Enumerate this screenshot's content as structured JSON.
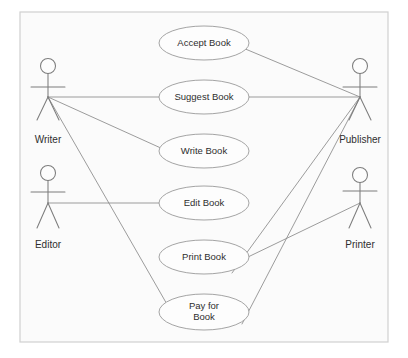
{
  "diagram": {
    "type": "uml-use-case-diagram",
    "title": "",
    "canvas": {
      "width": 408,
      "height": 358
    },
    "colors": {
      "page_background": "#ffffff",
      "frame_fill": "#fbfbfb",
      "frame_stroke": "#d0d0d0",
      "ellipse_fill": "#fdfdfd",
      "ellipse_stroke": "#9a9a9a",
      "line_stroke": "#8a8a8a",
      "actor_stroke": "#7d7d7d",
      "text_color": "#2e2e2e"
    },
    "frame": {
      "x": 20,
      "y": 12,
      "width": 368,
      "height": 330
    },
    "use_cases": [
      {
        "id": "accept-book",
        "label": "Accept Book",
        "label_lines": [
          "Accept Book"
        ],
        "cx": 204,
        "cy": 43,
        "rx": 45,
        "ry": 17
      },
      {
        "id": "suggest-book",
        "label": "Suggest Book",
        "label_lines": [
          "Suggest Book"
        ],
        "cx": 204,
        "cy": 97,
        "rx": 45,
        "ry": 17
      },
      {
        "id": "write-book",
        "label": "Write Book",
        "label_lines": [
          "Write Book"
        ],
        "cx": 204,
        "cy": 151,
        "rx": 45,
        "ry": 17
      },
      {
        "id": "edit-book",
        "label": "Edit Book",
        "label_lines": [
          "Edit Book"
        ],
        "cx": 204,
        "cy": 203,
        "rx": 45,
        "ry": 17
      },
      {
        "id": "print-book",
        "label": "Print Book",
        "label_lines": [
          "Print Book"
        ],
        "cx": 204,
        "cy": 257,
        "rx": 45,
        "ry": 17
      },
      {
        "id": "pay-for-book",
        "label": "Pay for Book",
        "label_lines": [
          "Pay for",
          "Book"
        ],
        "cx": 204,
        "cy": 312,
        "rx": 45,
        "ry": 18
      }
    ],
    "actors": [
      {
        "id": "writer",
        "label": "Writer",
        "x": 48,
        "head_cy": 66,
        "head_r": 7.5,
        "arms_y": 87,
        "hip_y": 97,
        "feet_y": 120,
        "leg_spread": 11,
        "arm_spread": 17,
        "label_y": 140
      },
      {
        "id": "editor",
        "label": "Editor",
        "x": 48,
        "head_cy": 173,
        "head_r": 7.5,
        "arms_y": 192,
        "hip_y": 203,
        "feet_y": 228,
        "leg_spread": 11,
        "arm_spread": 17,
        "label_y": 245
      },
      {
        "id": "publisher",
        "label": "Publisher",
        "x": 360,
        "head_cy": 66,
        "head_r": 7.5,
        "arms_y": 87,
        "hip_y": 97,
        "feet_y": 120,
        "leg_spread": 11,
        "arm_spread": 17,
        "label_y": 140
      },
      {
        "id": "printer",
        "label": "Printer",
        "x": 360,
        "head_cy": 175,
        "head_r": 7.5,
        "arms_y": 191,
        "hip_y": 203,
        "feet_y": 228,
        "leg_spread": 11,
        "arm_spread": 17,
        "label_y": 245
      }
    ],
    "associations": [
      {
        "id": "writer-suggest-book",
        "from": "writer",
        "to": "suggest-book",
        "x1": 48,
        "y1": 97,
        "x2": 159,
        "y2": 97
      },
      {
        "id": "writer-write-book",
        "from": "writer",
        "to": "write-book",
        "x1": 48,
        "y1": 97,
        "x2": 163,
        "y2": 149
      },
      {
        "id": "writer-pay-for-book",
        "from": "writer",
        "to": "pay-for-book",
        "x1": 48,
        "y1": 97,
        "x2": 168,
        "y2": 306
      },
      {
        "id": "editor-edit-book",
        "from": "editor",
        "to": "edit-book",
        "x1": 48,
        "y1": 203,
        "x2": 159,
        "y2": 203
      },
      {
        "id": "publisher-accept-book",
        "from": "publisher",
        "to": "accept-book",
        "x1": 360,
        "y1": 97,
        "x2": 243,
        "y2": 48
      },
      {
        "id": "publisher-suggest-book",
        "from": "publisher",
        "to": "suggest-book",
        "x1": 360,
        "y1": 97,
        "x2": 249,
        "y2": 97
      },
      {
        "id": "publisher-print-book",
        "from": "publisher",
        "to": "print-book",
        "x1": 360,
        "y1": 97,
        "x2": 232,
        "y2": 273
      },
      {
        "id": "publisher-pay-for-book",
        "from": "publisher",
        "to": "pay-for-book",
        "x1": 360,
        "y1": 97,
        "x2": 242,
        "y2": 324
      },
      {
        "id": "printer-print-book",
        "from": "printer",
        "to": "print-book",
        "x1": 360,
        "y1": 203,
        "x2": 248,
        "y2": 257
      }
    ]
  }
}
